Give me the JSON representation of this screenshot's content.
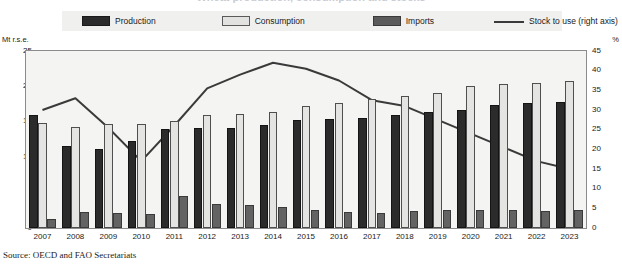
{
  "title": "Wheat production, consumption and stocks",
  "legend": {
    "items": [
      {
        "label": "Production",
        "key": "production",
        "marker": "bar",
        "color": "#2b2b2b"
      },
      {
        "label": "Consumption",
        "key": "consumption",
        "marker": "bar",
        "color": "#e4e4e2"
      },
      {
        "label": "Imports",
        "key": "imports",
        "marker": "bar",
        "color": "#636363"
      },
      {
        "label": "Stock to use (right axis)",
        "key": "stock_to_use",
        "marker": "line",
        "color": "#3a3a3a"
      }
    ]
  },
  "axes": {
    "left_unit": "Mt r.s.e.",
    "right_unit": "%",
    "left_ticks": [
      "0",
      "5",
      "10",
      "15",
      "20",
      "25"
    ],
    "right_ticks": [
      "0",
      "5",
      "10",
      "15",
      "20",
      "25",
      "30",
      "35",
      "40",
      "45"
    ]
  },
  "source": "Source:  OECD and FAO Secretariats",
  "chart_data": {
    "type": "bar",
    "title": "Wheat production, consumption and stocks",
    "xlabel": "",
    "ylabel": "Mt r.s.e.",
    "y2label": "%",
    "ylim": [
      0,
      25
    ],
    "y2lim": [
      0,
      45
    ],
    "grid": false,
    "legend_position": "top",
    "categories": [
      "2007",
      "2008",
      "2009",
      "2010",
      "2011",
      "2012",
      "2013",
      "2014",
      "2015",
      "2016",
      "2017",
      "2018",
      "2019",
      "2020",
      "2021",
      "2022",
      "2023"
    ],
    "series": [
      {
        "name": "Production",
        "type": "bar",
        "axis": "left",
        "color": "#2b2b2b",
        "values": [
          16.0,
          11.6,
          11.2,
          12.3,
          14.0,
          14.1,
          14.1,
          14.5,
          15.2,
          15.4,
          15.5,
          16.0,
          16.4,
          16.6,
          17.4,
          17.6,
          17.8
        ]
      },
      {
        "name": "Consumption",
        "type": "bar",
        "axis": "left",
        "color": "#e4e4e2",
        "values": [
          14.8,
          14.3,
          14.7,
          14.7,
          15.1,
          15.9,
          16.1,
          16.4,
          17.2,
          17.7,
          18.2,
          18.7,
          19.0,
          20.0,
          20.4,
          20.5,
          20.8
        ]
      },
      {
        "name": "Imports",
        "type": "bar",
        "axis": "left",
        "color": "#636363",
        "values": [
          1.3,
          2.2,
          2.1,
          2.0,
          4.5,
          3.4,
          3.2,
          3.0,
          2.5,
          2.2,
          2.1,
          2.4,
          2.6,
          2.6,
          2.6,
          2.4,
          2.5
        ]
      },
      {
        "name": "Stock to use (right axis)",
        "type": "line",
        "axis": "right",
        "color": "#3a3a3a",
        "values": [
          30.0,
          33.0,
          25.5,
          17.0,
          26.0,
          35.5,
          39.0,
          42.0,
          40.5,
          37.5,
          32.5,
          31.0,
          27.5,
          24.0,
          20.5,
          17.0,
          15.0
        ]
      }
    ]
  }
}
